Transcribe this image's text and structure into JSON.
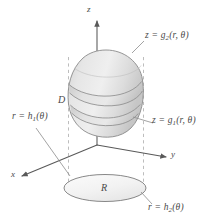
{
  "figure": {
    "background_color": "#ffffff",
    "line_color": "#595959",
    "dash_color": "#b0b0b0",
    "solid_fill_light": "#ececec",
    "solid_fill_mid": "#dcdcdc",
    "solid_fill_dark": "#c9c9c9",
    "label_color": "#4a4a4a"
  },
  "axes": {
    "z": {
      "text": "z"
    },
    "y": {
      "text": "y"
    },
    "x": {
      "text": "x"
    }
  },
  "labels": {
    "solid": {
      "text": "D"
    },
    "region": {
      "text": "R"
    },
    "top_surface": {
      "prefix": "z = g",
      "subscript": "2",
      "args": "(r, θ)"
    },
    "bottom_surface": {
      "prefix": "z = g",
      "subscript": "1",
      "args": "(r, θ)"
    },
    "inner_boundary": {
      "prefix": "r = h",
      "subscript": "1",
      "args": "(θ)"
    },
    "outer_boundary": {
      "prefix": "r = h",
      "subscript": "2",
      "args": "(θ)"
    }
  }
}
